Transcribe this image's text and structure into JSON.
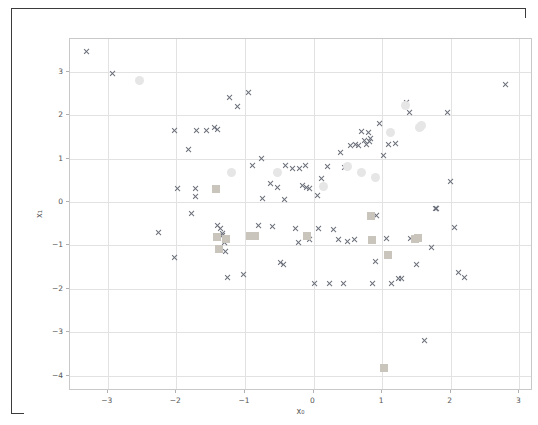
{
  "window": {
    "title": "",
    "background_color": "#ffffff",
    "frame_color": "#3b3b3b"
  },
  "chart_data": {
    "type": "scatter",
    "title": "",
    "xlabel": "x₀",
    "ylabel": "x₁",
    "xlim": [
      -3.55,
      3.2
    ],
    "ylim": [
      -4.35,
      3.75
    ],
    "xticks": [
      -3,
      -2,
      -1,
      0,
      1,
      2,
      3
    ],
    "xticklabels": [
      "−3",
      "−2",
      "−1",
      "0",
      "1",
      "2",
      "3"
    ],
    "yticks": [
      3,
      2,
      1,
      0,
      -1,
      -2,
      -3,
      -4
    ],
    "yticklabels": [
      "3",
      "2",
      "1",
      "0",
      "−1",
      "−2",
      "−3",
      "−4"
    ],
    "grid": true,
    "grid_color": "#e2e2e2",
    "legend": null,
    "series": [
      {
        "name": "cross-markers",
        "marker": "x",
        "color": "#6b6f7a",
        "points": [
          [
            -3.3,
            3.47
          ],
          [
            -2.93,
            2.96
          ],
          [
            -2.26,
            -0.7
          ],
          [
            -2.02,
            1.64
          ],
          [
            -2.02,
            -1.28
          ],
          [
            -1.98,
            0.3
          ],
          [
            -1.82,
            1.2
          ],
          [
            -1.78,
            -0.26
          ],
          [
            -1.72,
            0.3
          ],
          [
            -1.72,
            0.12
          ],
          [
            -1.7,
            1.64
          ],
          [
            -1.55,
            1.64
          ],
          [
            -1.44,
            1.72
          ],
          [
            -1.4,
            1.66
          ],
          [
            -1.39,
            -0.55
          ],
          [
            -1.36,
            -0.62
          ],
          [
            -1.33,
            -0.72
          ],
          [
            -1.32,
            -0.78
          ],
          [
            -1.3,
            -0.93
          ],
          [
            -1.28,
            -1.15
          ],
          [
            -1.25,
            -1.73
          ],
          [
            -1.22,
            2.4
          ],
          [
            -1.1,
            2.2
          ],
          [
            -1.02,
            -1.66
          ],
          [
            -0.95,
            2.51
          ],
          [
            -0.88,
            0.84
          ],
          [
            -0.8,
            -0.55
          ],
          [
            -0.76,
            1.0
          ],
          [
            -0.74,
            0.08
          ],
          [
            -0.62,
            0.42
          ],
          [
            -0.6,
            -0.57
          ],
          [
            -0.52,
            0.33
          ],
          [
            -0.48,
            -1.4
          ],
          [
            -0.44,
            -1.44
          ],
          [
            -0.42,
            0.05
          ],
          [
            -0.4,
            0.83
          ],
          [
            -0.3,
            0.78
          ],
          [
            -0.26,
            -0.6
          ],
          [
            -0.22,
            -0.93
          ],
          [
            -0.2,
            0.77
          ],
          [
            -0.16,
            0.38
          ],
          [
            -0.12,
            0.83
          ],
          [
            -0.1,
            0.33
          ],
          [
            -0.06,
            -0.86
          ],
          [
            -0.05,
            0.3
          ],
          [
            0.02,
            -1.88
          ],
          [
            0.06,
            0.14
          ],
          [
            0.08,
            -0.61
          ],
          [
            0.12,
            0.55
          ],
          [
            0.2,
            0.82
          ],
          [
            0.24,
            -1.88
          ],
          [
            0.3,
            -0.64
          ],
          [
            0.36,
            -0.86
          ],
          [
            0.4,
            1.13
          ],
          [
            0.44,
            -1.88
          ],
          [
            0.46,
            0.8
          ],
          [
            0.5,
            -0.9
          ],
          [
            0.54,
            1.3
          ],
          [
            0.6,
            -0.86
          ],
          [
            0.62,
            1.32
          ],
          [
            0.66,
            1.3
          ],
          [
            0.7,
            1.62
          ],
          [
            0.74,
            1.42
          ],
          [
            0.78,
            1.32
          ],
          [
            0.8,
            1.6
          ],
          [
            0.82,
            1.38
          ],
          [
            0.84,
            1.46
          ],
          [
            0.86,
            -1.88
          ],
          [
            0.9,
            -1.36
          ],
          [
            0.92,
            -0.32
          ],
          [
            0.96,
            1.8
          ],
          [
            1.02,
            1.08
          ],
          [
            1.06,
            -0.85
          ],
          [
            1.1,
            1.33
          ],
          [
            1.14,
            -1.88
          ],
          [
            1.2,
            1.35
          ],
          [
            1.24,
            -1.75
          ],
          [
            1.28,
            -1.75
          ],
          [
            1.36,
            2.28
          ],
          [
            1.4,
            2.06
          ],
          [
            1.42,
            -0.85
          ],
          [
            1.5,
            -1.45
          ],
          [
            1.56,
            1.72
          ],
          [
            1.62,
            -3.18
          ],
          [
            1.72,
            -1.05
          ],
          [
            1.78,
            -0.15
          ],
          [
            1.8,
            -0.16
          ],
          [
            1.96,
            2.05
          ],
          [
            2.0,
            0.47
          ],
          [
            2.06,
            -0.58
          ],
          [
            2.12,
            -1.62
          ],
          [
            2.2,
            -1.74
          ],
          [
            2.8,
            2.7
          ]
        ]
      },
      {
        "name": "square-markers",
        "marker": "s",
        "color": "#c9c5bd",
        "points": [
          [
            -1.42,
            0.3
          ],
          [
            -1.4,
            -0.8
          ],
          [
            -1.38,
            -1.08
          ],
          [
            -1.28,
            -0.85
          ],
          [
            -0.92,
            -0.78
          ],
          [
            -0.86,
            -0.78
          ],
          [
            -0.1,
            -0.78
          ],
          [
            0.84,
            -0.32
          ],
          [
            0.86,
            -0.88
          ],
          [
            1.03,
            -3.82
          ],
          [
            1.08,
            -1.23
          ],
          [
            1.48,
            -0.85
          ],
          [
            1.52,
            -0.82
          ]
        ]
      },
      {
        "name": "circle-markers",
        "marker": "o",
        "color": "#e6e6e6",
        "points": [
          [
            -2.54,
            2.8
          ],
          [
            -1.2,
            0.67
          ],
          [
            -0.52,
            0.68
          ],
          [
            0.14,
            0.36
          ],
          [
            0.5,
            0.82
          ],
          [
            0.7,
            0.68
          ],
          [
            0.9,
            0.56
          ],
          [
            1.12,
            1.6
          ],
          [
            1.34,
            2.22
          ],
          [
            1.54,
            1.72
          ],
          [
            1.58,
            1.75
          ]
        ]
      }
    ]
  }
}
